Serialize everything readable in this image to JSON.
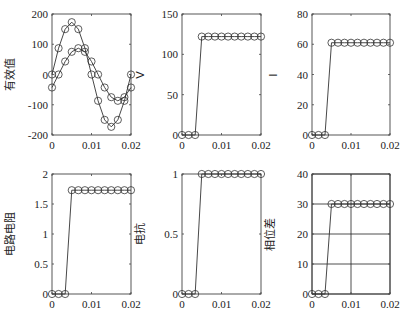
{
  "chart_data": [
    {
      "type": "line",
      "title": "",
      "xlabel": "",
      "ylabel": "有效值",
      "ylabel_right": "V",
      "xlim": [
        0,
        0.02
      ],
      "ylim": [
        -200,
        200
      ],
      "xticks": [
        "0",
        "0.01",
        "0.02"
      ],
      "yticks": [
        "-200",
        "-100",
        "0",
        "100",
        "200"
      ],
      "grid": false,
      "marker": "circle",
      "x": [
        0,
        0.001667,
        0.003333,
        0.005,
        0.006667,
        0.008333,
        0.01,
        0.011667,
        0.013333,
        0.015,
        0.016667,
        0.018333,
        0.02
      ],
      "series": [
        {
          "name": "voltage",
          "values": [
            0,
            87,
            150,
            173,
            150,
            87,
            0,
            -87,
            -150,
            -173,
            -150,
            -87,
            0
          ]
        },
        {
          "name": "current",
          "values": [
            -43,
            0,
            43,
            75,
            87,
            75,
            43,
            0,
            -43,
            -75,
            -87,
            -75,
            -43
          ]
        }
      ]
    },
    {
      "type": "line",
      "ylabel": "",
      "ylabel_right": "I",
      "xlim": [
        0,
        0.02
      ],
      "ylim": [
        0,
        150
      ],
      "xticks": [
        "0",
        "0.01",
        "0.02"
      ],
      "yticks": [
        "0",
        "50",
        "100",
        "150"
      ],
      "grid": false,
      "marker": "circle",
      "x": [
        0,
        0.001667,
        0.003333,
        0.005,
        0.006667,
        0.008333,
        0.01,
        0.011667,
        0.013333,
        0.015,
        0.016667,
        0.018333,
        0.02
      ],
      "series": [
        {
          "name": "V",
          "values": [
            0,
            0,
            0,
            122,
            122,
            122,
            122,
            122,
            122,
            122,
            122,
            122,
            122
          ]
        }
      ]
    },
    {
      "type": "line",
      "ylabel": "",
      "xlim": [
        0,
        0.02
      ],
      "ylim": [
        0,
        80
      ],
      "xticks": [
        "0",
        "0.01",
        "0.02"
      ],
      "yticks": [
        "0",
        "20",
        "40",
        "60",
        "80"
      ],
      "grid": false,
      "marker": "circle",
      "x": [
        0,
        0.001667,
        0.003333,
        0.005,
        0.006667,
        0.008333,
        0.01,
        0.011667,
        0.013333,
        0.015,
        0.016667,
        0.018333,
        0.02
      ],
      "series": [
        {
          "name": "I",
          "values": [
            0,
            0,
            0,
            61,
            61,
            61,
            61,
            61,
            61,
            61,
            61,
            61,
            61
          ]
        }
      ]
    },
    {
      "type": "line",
      "ylabel": "电路电阻",
      "xlim": [
        0,
        0.02
      ],
      "ylim": [
        0,
        2
      ],
      "xticks": [
        "0",
        "0.01",
        "0.02"
      ],
      "yticks": [
        "0",
        "0.5",
        "1",
        "1.5",
        "2"
      ],
      "grid": false,
      "marker": "circle",
      "x": [
        0,
        0.001667,
        0.003333,
        0.005,
        0.006667,
        0.008333,
        0.01,
        0.011667,
        0.013333,
        0.015,
        0.016667,
        0.018333,
        0.02
      ],
      "series": [
        {
          "name": "R",
          "values": [
            0,
            0,
            0,
            1.73,
            1.73,
            1.73,
            1.73,
            1.73,
            1.73,
            1.73,
            1.73,
            1.73,
            1.73
          ]
        }
      ]
    },
    {
      "type": "line",
      "ylabel": "电抗",
      "xlim": [
        0,
        0.02
      ],
      "ylim": [
        0,
        1
      ],
      "xticks": [
        "0",
        "0.01",
        "0.02"
      ],
      "yticks": [
        "0",
        "0.5",
        "1"
      ],
      "grid": false,
      "marker": "circle",
      "x": [
        0,
        0.001667,
        0.003333,
        0.005,
        0.006667,
        0.008333,
        0.01,
        0.011667,
        0.013333,
        0.015,
        0.016667,
        0.018333,
        0.02
      ],
      "series": [
        {
          "name": "X",
          "values": [
            0,
            0,
            0,
            1,
            1,
            1,
            1,
            1,
            1,
            1,
            1,
            1,
            1
          ]
        }
      ]
    },
    {
      "type": "line",
      "ylabel": "相位差",
      "xlim": [
        0,
        0.02
      ],
      "ylim": [
        0,
        40
      ],
      "xticks": [
        "0",
        "0.01",
        "0.02"
      ],
      "yticks": [
        "0",
        "10",
        "20",
        "30",
        "40"
      ],
      "grid": true,
      "marker": "circle",
      "x": [
        0,
        0.001667,
        0.003333,
        0.005,
        0.006667,
        0.008333,
        0.01,
        0.011667,
        0.013333,
        0.015,
        0.016667,
        0.018333,
        0.02
      ],
      "series": [
        {
          "name": "phase",
          "values": [
            0,
            0,
            0,
            30,
            30,
            30,
            30,
            30,
            30,
            30,
            30,
            30,
            30
          ]
        }
      ]
    }
  ],
  "layout": {
    "panels": [
      {
        "x0": 52,
        "x1": 131,
        "y0": 14,
        "y1": 135
      },
      {
        "x0": 182,
        "x1": 261,
        "y0": 14,
        "y1": 135
      },
      {
        "x0": 312,
        "x1": 390,
        "y0": 14,
        "y1": 135
      },
      {
        "x0": 52,
        "x1": 131,
        "y0": 174,
        "y1": 294
      },
      {
        "x0": 182,
        "x1": 261,
        "y0": 174,
        "y1": 294
      },
      {
        "x0": 312,
        "x1": 390,
        "y0": 174,
        "y1": 294
      }
    ],
    "colors": {
      "line": "#333333",
      "axis": "#444444",
      "grid": "#222222"
    }
  }
}
